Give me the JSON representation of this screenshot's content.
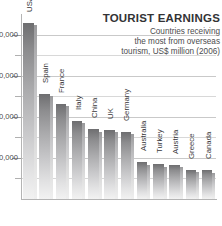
{
  "title": "TOURIST EARNINGS",
  "subtitle_lines": [
    "Countries receiving",
    "the most from overseas",
    "tourism, US$ million (2006)"
  ],
  "colors": {
    "bar_top": "#6e6e70",
    "bar_bottom": "#f2f2f2",
    "title_text": "#333335",
    "subtitle_text": "#4c4c4e",
    "axis": "#b4b4b4",
    "gridline": "#d8d8d8",
    "background": "#ffffff"
  },
  "chart_data": {
    "type": "bar",
    "title": "TOURIST EARNINGS",
    "subtitle": "Countries receiving the most from overseas tourism, US$ million (2006)",
    "xlabel": "",
    "ylabel": "US$ million",
    "grid": true,
    "legend": false,
    "ylim": [
      0,
      90000
    ],
    "yticks": [
      0,
      20000,
      40000,
      60000,
      80000
    ],
    "ytick_labels": [
      "",
      "0,000",
      "0,000",
      "0,000",
      "0,000"
    ],
    "ytick_labels_clipped": true,
    "categories": [
      "USA",
      "Spain",
      "France",
      "Italy",
      "China",
      "UK",
      "Germany",
      "Australia",
      "Turkey",
      "Austria",
      "Greece",
      "Canada"
    ],
    "values": [
      85700,
      51100,
      46300,
      38100,
      33900,
      33700,
      32800,
      17800,
      16900,
      16600,
      14300,
      14000
    ]
  },
  "y_tick_labels": [
    {
      "text": "0,000",
      "value": 80000
    },
    {
      "text": "0,000",
      "value": 60000
    },
    {
      "text": "0,000",
      "value": 40000
    },
    {
      "text": "0,000",
      "value": 20000
    }
  ],
  "bars": [
    {
      "label": "USA",
      "value": 85700
    },
    {
      "label": "Spain",
      "value": 51100
    },
    {
      "label": "France",
      "value": 46300
    },
    {
      "label": "Italy",
      "value": 38100
    },
    {
      "label": "China",
      "value": 33900
    },
    {
      "label": "UK",
      "value": 33700
    },
    {
      "label": "Germany",
      "value": 32800
    },
    {
      "label": "Australia",
      "value": 17800
    },
    {
      "label": "Turkey",
      "value": 16900
    },
    {
      "label": "Austria",
      "value": 16600
    },
    {
      "label": "Greece",
      "value": 14300
    },
    {
      "label": "Canada",
      "value": 14000
    }
  ]
}
